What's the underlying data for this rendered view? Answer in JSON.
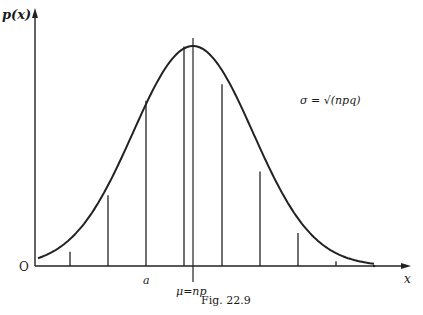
{
  "figure": {
    "caption": "Fig. 22.9",
    "y_axis_label": "p(x)",
    "x_axis_label": "x",
    "origin_label": "O",
    "annotation_sigma": "σ = √(npq)",
    "mark_a": "a",
    "mark_mu": "μ=np"
  },
  "chart_data": {
    "type": "line",
    "title": "Fig. 22.9",
    "xlabel": "x",
    "ylabel": "p(x)",
    "curve": "normal distribution approximating binomial",
    "mean_label": "μ=np",
    "sigma_label": "σ = √(npq)",
    "ordinates": [
      {
        "k": -3,
        "relative_height": 0.06
      },
      {
        "k": -2,
        "relative_height": 0.3
      },
      {
        "k": -1,
        "relative_height": 0.7
      },
      {
        "k": 0,
        "relative_height": 0.93
      },
      {
        "k": 1,
        "relative_height": 0.77
      },
      {
        "k": 2,
        "relative_height": 0.4
      },
      {
        "k": 3,
        "relative_height": 0.14
      },
      {
        "k": 4,
        "relative_height": 0.02
      }
    ],
    "grid": false,
    "legend": "none"
  }
}
